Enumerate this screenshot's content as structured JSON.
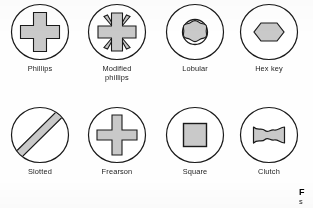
{
  "figure": {
    "caption_line1": "F",
    "caption_line2": "s",
    "background_color": "#ffffff",
    "stroke_color": "#1a1a1a",
    "recess_fill_color": "#c9c9c9",
    "circle_fill_color": "#ffffff"
  },
  "drives": [
    {
      "id": "phillips",
      "label": "Phillips",
      "icon": "phillips-recess-icon",
      "row": 1,
      "column": 1
    },
    {
      "id": "modified-phillips",
      "label": "Modified\nphillips",
      "icon": "modified-phillips-recess-icon",
      "row": 1,
      "column": 2
    },
    {
      "id": "lobular",
      "label": "Lobular",
      "icon": "lobular-recess-icon",
      "row": 1,
      "column": 3
    },
    {
      "id": "hex-key",
      "label": "Hex key",
      "icon": "hex-key-recess-icon",
      "row": 1,
      "column": 4
    },
    {
      "id": "slotted",
      "label": "Slotted",
      "icon": "slotted-recess-icon",
      "row": 2,
      "column": 1
    },
    {
      "id": "frearson",
      "label": "Frearson",
      "icon": "frearson-recess-icon",
      "row": 2,
      "column": 2
    },
    {
      "id": "square",
      "label": "Square",
      "icon": "square-recess-icon",
      "row": 2,
      "column": 3
    },
    {
      "id": "clutch",
      "label": "Clutch",
      "icon": "clutch-recess-icon",
      "row": 2,
      "column": 4
    }
  ]
}
